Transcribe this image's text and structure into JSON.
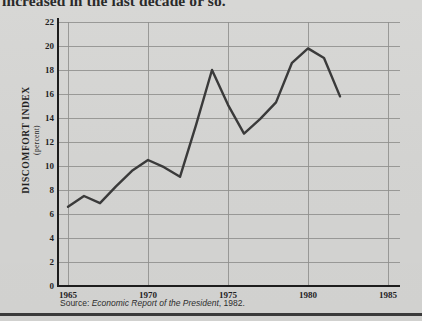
{
  "page": {
    "background_color": "#d5d5d3",
    "heading_partial": "increased in the last decade or so.",
    "bottom_rule_color": "#3a3a3a"
  },
  "source": {
    "prefix": "Source: ",
    "publication": "Economic Report of the President",
    "suffix": ", 1982."
  },
  "axis": {
    "y_title": "DISCOMFORT INDEX",
    "y_subtitle": "(percent)",
    "y_ticks": [
      "0",
      "2",
      "4",
      "6",
      "8",
      "10",
      "12",
      "14",
      "16",
      "18",
      "20",
      "22"
    ],
    "x_ticks": [
      "1965",
      "1970",
      "1975",
      "1980",
      "1985"
    ]
  },
  "chart_data": {
    "type": "line",
    "title": "",
    "subtitle": "",
    "xlabel": "",
    "ylabel": "DISCOMFORT INDEX (percent)",
    "xlim": [
      1965,
      1985
    ],
    "ylim": [
      0,
      22
    ],
    "x_tick_values": [
      1965,
      1970,
      1975,
      1980,
      1985
    ],
    "y_tick_values": [
      0,
      2,
      4,
      6,
      8,
      10,
      12,
      14,
      16,
      18,
      20,
      22
    ],
    "grid": true,
    "legend": false,
    "line_color": "#3a3a3a",
    "line_width": 2.4,
    "series": [
      {
        "name": "Discomfort index",
        "x": [
          1965,
          1966,
          1967,
          1968,
          1969,
          1970,
          1971,
          1972,
          1973,
          1974,
          1975,
          1976,
          1977,
          1978,
          1979,
          1980,
          1981,
          1982
        ],
        "values": [
          6.6,
          7.5,
          6.9,
          8.3,
          9.6,
          10.5,
          9.9,
          9.1,
          13.4,
          18.0,
          15.1,
          12.7,
          13.9,
          15.3,
          18.6,
          19.8,
          19.0,
          15.8
        ]
      }
    ],
    "annotations": [
      {
        "label": "first peak",
        "x": 1974,
        "y": 18.0
      },
      {
        "label": "trough",
        "x": 1976,
        "y": 12.7
      },
      {
        "label": "second peak",
        "x": 1980,
        "y": 19.8
      },
      {
        "label": "series end",
        "x": 1982,
        "y": 15.8
      }
    ]
  }
}
